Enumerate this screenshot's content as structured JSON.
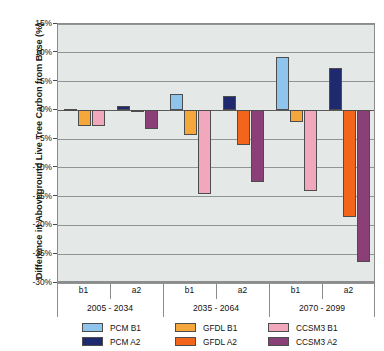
{
  "chart_data": {
    "type": "bar",
    "title": "",
    "xlabel": "",
    "ylabel": "Difference in Aboveground Live Tree Carbon from Base (%)",
    "ylim": [
      -30,
      15
    ],
    "ytick_values": [
      15,
      10,
      5,
      0,
      -5,
      -10,
      -15,
      -20,
      -25,
      -30
    ],
    "ytick_labels": [
      "15%",
      "10%",
      "5%",
      "0%",
      "-5%",
      "-10%",
      "-15%",
      "-20%",
      "-25%",
      "-30%"
    ],
    "grid": true,
    "legend_position": "bottom",
    "groups": [
      {
        "period": "2005 - 2034",
        "subcategories": [
          "b1",
          "a2"
        ]
      },
      {
        "period": "2035 - 2064",
        "subcategories": [
          "b1",
          "a2"
        ]
      },
      {
        "period": "2070 - 2099",
        "subcategories": [
          "b1",
          "a2"
        ]
      }
    ],
    "categories": [
      "2005 - 2034 b1",
      "2005 - 2034 a2",
      "2035 - 2064 b1",
      "2035 - 2064 a2",
      "2070 - 2099 b1",
      "2070 - 2099 a2"
    ],
    "series": [
      {
        "name": "PCM B1",
        "scenario": "b1",
        "color": "#8FC5EC",
        "values": [
          0.2,
          null,
          2.8,
          null,
          9.2,
          null
        ]
      },
      {
        "name": "PCM A2",
        "scenario": "a2",
        "color": "#1F2A6E",
        "values": [
          null,
          0.7,
          null,
          2.5,
          null,
          7.3
        ]
      },
      {
        "name": "GFDL B1",
        "scenario": "b1",
        "color": "#F5A73C",
        "values": [
          -2.7,
          null,
          -4.2,
          null,
          -2.0,
          null
        ]
      },
      {
        "name": "GFDL A2",
        "scenario": "a2",
        "color": "#F4651C",
        "values": [
          null,
          0.0,
          null,
          -6.1,
          null,
          -18.5
        ]
      },
      {
        "name": "CCSM3 B1",
        "scenario": "b1",
        "color": "#F2A8BC",
        "values": [
          -2.7,
          null,
          -14.5,
          null,
          -14.1,
          null
        ]
      },
      {
        "name": "CCSM3 A2",
        "scenario": "a2",
        "color": "#8B3F77",
        "values": [
          null,
          -3.2,
          null,
          -12.4,
          null,
          -26.3
        ]
      }
    ],
    "bars": [
      {
        "group": 0,
        "sub": "b1",
        "series": "PCM B1",
        "value": 0.2,
        "color": "#8FC5EC"
      },
      {
        "group": 0,
        "sub": "b1",
        "series": "GFDL B1",
        "value": -2.7,
        "color": "#F5A73C"
      },
      {
        "group": 0,
        "sub": "b1",
        "series": "CCSM3 B1",
        "value": -2.7,
        "color": "#F2A8BC"
      },
      {
        "group": 0,
        "sub": "a2",
        "series": "PCM A2",
        "value": 0.7,
        "color": "#1F2A6E"
      },
      {
        "group": 0,
        "sub": "a2",
        "series": "GFDL A2",
        "value": 0.0,
        "color": "#F4651C"
      },
      {
        "group": 0,
        "sub": "a2",
        "series": "CCSM3 A2",
        "value": -3.2,
        "color": "#8B3F77"
      },
      {
        "group": 1,
        "sub": "b1",
        "series": "PCM B1",
        "value": 2.8,
        "color": "#8FC5EC"
      },
      {
        "group": 1,
        "sub": "b1",
        "series": "GFDL B1",
        "value": -4.2,
        "color": "#F5A73C"
      },
      {
        "group": 1,
        "sub": "b1",
        "series": "CCSM3 B1",
        "value": -14.5,
        "color": "#F2A8BC"
      },
      {
        "group": 1,
        "sub": "a2",
        "series": "PCM A2",
        "value": 2.5,
        "color": "#1F2A6E"
      },
      {
        "group": 1,
        "sub": "a2",
        "series": "GFDL A2",
        "value": -6.1,
        "color": "#F4651C"
      },
      {
        "group": 1,
        "sub": "a2",
        "series": "CCSM3 A2",
        "value": -12.4,
        "color": "#8B3F77"
      },
      {
        "group": 2,
        "sub": "b1",
        "series": "PCM B1",
        "value": 9.2,
        "color": "#8FC5EC"
      },
      {
        "group": 2,
        "sub": "b1",
        "series": "GFDL B1",
        "value": -2.0,
        "color": "#F5A73C"
      },
      {
        "group": 2,
        "sub": "b1",
        "series": "CCSM3 B1",
        "value": -14.1,
        "color": "#F2A8BC"
      },
      {
        "group": 2,
        "sub": "a2",
        "series": "PCM A2",
        "value": 7.3,
        "color": "#1F2A6E"
      },
      {
        "group": 2,
        "sub": "a2",
        "series": "GFDL A2",
        "value": -18.5,
        "color": "#F4651C"
      },
      {
        "group": 2,
        "sub": "a2",
        "series": "CCSM3 A2",
        "value": -26.3,
        "color": "#8B3F77"
      }
    ],
    "legend": [
      {
        "label": "PCM B1",
        "color": "#8FC5EC"
      },
      {
        "label": "GFDL B1",
        "color": "#F5A73C"
      },
      {
        "label": "CCSM3 B1",
        "color": "#F2A8BC"
      },
      {
        "label": "PCM A2",
        "color": "#1F2A6E"
      },
      {
        "label": "GFDL A2",
        "color": "#F4651C"
      },
      {
        "label": "CCSM3 A2",
        "color": "#8B3F77"
      }
    ]
  },
  "axis": {
    "ylabel": "Difference in Aboveground Live Tree Carbon from Base (%)"
  },
  "colors": {
    "plot_background": "#e4e8e7",
    "gridline": "#8f9594",
    "axis_line": "#8c8c8c",
    "zero_line": "#5a5a5a",
    "text": "#111111"
  }
}
